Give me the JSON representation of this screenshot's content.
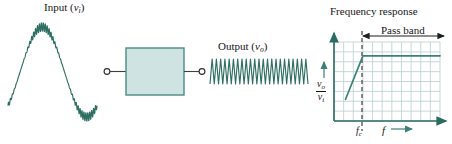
{
  "figure": {
    "accent_color": "#3d8078",
    "wave_color": "#2f6f63",
    "box_fill": "#cfe4e2",
    "box_stroke": "#4b8b84",
    "grid_color": "#b9cfcd",
    "axis_color": "#2a6a60",
    "text_color": "#161616"
  },
  "diagram": {
    "input_label": {
      "text": "Input",
      "variable": "v",
      "subscript": "i"
    },
    "output_label": {
      "text": "Output",
      "variable": "v",
      "subscript": "o"
    },
    "filter_box": {
      "line1": "High-pass",
      "line2": "filter"
    },
    "terminals": {
      "count": 2,
      "shape": "open-circle"
    }
  },
  "chart_data": {
    "type": "line",
    "title": "Frequency response",
    "xlabel": "f",
    "ylabel": "vo/vi",
    "ylabel_numerator": "v",
    "ylabel_numerator_sub": "o",
    "ylabel_denominator": "v",
    "ylabel_denominator_sub": "i",
    "grid": true,
    "grid_cols": 11,
    "grid_rows": 8,
    "xlim": [
      0,
      11
    ],
    "ylim": [
      0,
      8
    ],
    "x": [
      1.2,
      3.0,
      11.0
    ],
    "values": [
      2.2,
      6.6,
      6.6
    ],
    "annotations": [
      {
        "name": "cutoff-line",
        "label": "fc",
        "label_base": "f",
        "label_sub": "c",
        "x": 3.0,
        "style": "dashed-vertical"
      },
      {
        "name": "pass-band-span",
        "label": "Pass band",
        "x_start": 3.0,
        "x_end": 11.0,
        "style": "double-arrow"
      }
    ],
    "legend": null,
    "tick_labels_x": [
      "fc"
    ],
    "tick_labels_y": []
  },
  "waveforms": {
    "input": {
      "name": "input-waveform",
      "description": "low-frequency sine with high-frequency ripple",
      "carrier_cycles": 1,
      "ripple_cycles": 46
    },
    "output": {
      "name": "output-waveform",
      "description": "high-frequency oscillation only",
      "ripple_cycles": 23
    }
  }
}
